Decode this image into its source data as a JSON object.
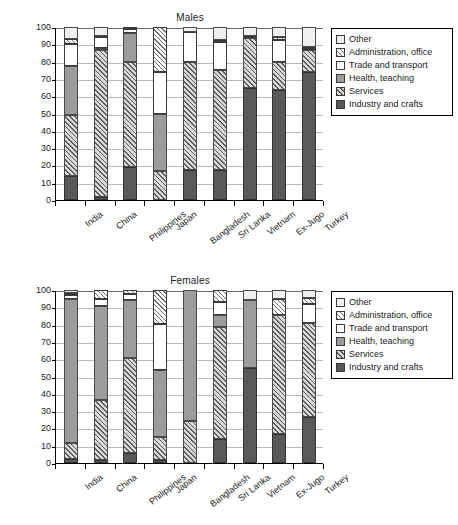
{
  "ylabel": "Percentage",
  "yticks": [
    0,
    10,
    20,
    30,
    40,
    50,
    60,
    70,
    80,
    90,
    100
  ],
  "categories": [
    "India",
    "China",
    "Philippines",
    "Japan",
    "Bangladesh",
    "Sri Lanka",
    "Vietnam",
    "Ex-Jugo",
    "Turkey"
  ],
  "legend": {
    "items": [
      {
        "label": "Other",
        "key": "other",
        "color": "#efefef"
      },
      {
        "label": "Administration, office",
        "key": "admin",
        "color": "#ffffff"
      },
      {
        "label": "Trade and transport",
        "key": "trade",
        "color": "#ffffff"
      },
      {
        "label": "Health, teaching",
        "key": "health",
        "color": "#9c9c9c"
      },
      {
        "label": "Services",
        "key": "services",
        "color": "#d8d8d8"
      },
      {
        "label": "Industry and crafts",
        "key": "industry",
        "color": "#595959"
      }
    ]
  },
  "panels": [
    {
      "id": "males",
      "title": "Males"
    },
    {
      "id": "females",
      "title": "Females"
    }
  ],
  "chart_data": [
    {
      "type": "bar",
      "title": "Males",
      "stacked": true,
      "xlabel": "",
      "ylabel": "Percentage",
      "ylim": [
        0,
        100
      ],
      "grid": true,
      "legend_position": "right",
      "categories": [
        "India",
        "China",
        "Philippines",
        "Japan",
        "Bangladesh",
        "Sri Lanka",
        "Vietnam",
        "Ex-Jugo",
        "Turkey"
      ],
      "series": [
        {
          "name": "Industry and crafts",
          "values": [
            14.0,
            2.0,
            19.0,
            0.0,
            17.5,
            17.5,
            64.5,
            63.5,
            74.0
          ]
        },
        {
          "name": "Services",
          "values": [
            35.0,
            84.5,
            60.5,
            16.5,
            62.0,
            57.5,
            29.0,
            16.0,
            13.0
          ]
        },
        {
          "name": "Health, teaching",
          "values": [
            28.5,
            1.5,
            17.0,
            33.0,
            0.0,
            0.0,
            0.0,
            0.0,
            0.0
          ]
        },
        {
          "name": "Trade and transport",
          "values": [
            12.5,
            6.5,
            2.5,
            24.5,
            17.5,
            16.5,
            1.5,
            13.0,
            0.5
          ]
        },
        {
          "name": "Administration, office",
          "values": [
            3.0,
            0.5,
            1.0,
            26.0,
            0.0,
            1.0,
            0.0,
            1.5,
            1.0
          ]
        },
        {
          "name": "Other",
          "values": [
            7.0,
            5.0,
            0.0,
            0.0,
            3.0,
            7.5,
            5.0,
            6.0,
            11.5
          ]
        }
      ],
      "cumulative_tops": {
        "India": [
          14.0,
          49.0,
          77.5,
          90.0,
          93.0,
          100.0
        ],
        "China": [
          2.0,
          86.5,
          88.0,
          94.5,
          95.0,
          100.0
        ],
        "Philippines": [
          19.0,
          79.5,
          96.5,
          99.0,
          100.0,
          100.0
        ],
        "Japan": [
          0.0,
          16.5,
          49.5,
          74.0,
          100.0,
          100.0
        ],
        "Bangladesh": [
          17.5,
          79.5,
          79.5,
          97.0,
          97.0,
          100.0
        ],
        "Sri Lanka": [
          17.5,
          75.0,
          75.0,
          91.5,
          92.5,
          100.0
        ],
        "Vietnam": [
          64.5,
          93.5,
          93.5,
          95.0,
          95.0,
          100.0
        ],
        "Ex-Jugo": [
          63.5,
          79.5,
          79.5,
          92.5,
          94.0,
          100.0
        ],
        "Turkey": [
          74.0,
          87.0,
          87.0,
          87.5,
          88.5,
          100.0
        ]
      }
    },
    {
      "type": "bar",
      "title": "Females",
      "stacked": true,
      "xlabel": "",
      "ylabel": "Percentage",
      "ylim": [
        0,
        100
      ],
      "grid": true,
      "legend_position": "right",
      "categories": [
        "India",
        "China",
        "Philippines",
        "Japan",
        "Bangladesh",
        "Sri Lanka",
        "Vietnam",
        "Ex-Jugo",
        "Turkey"
      ],
      "series": [
        {
          "name": "Industry and crafts",
          "values": [
            2.5,
            1.5,
            6.0,
            1.5,
            0.0,
            14.0,
            55.0,
            17.0,
            26.5
          ]
        },
        {
          "name": "Services",
          "values": [
            9.0,
            35.0,
            54.5,
            13.5,
            24.5,
            64.5,
            0.0,
            68.5,
            54.5
          ]
        },
        {
          "name": "Health, teaching",
          "values": [
            83.5,
            54.5,
            33.5,
            38.5,
            75.5,
            7.0,
            39.5,
            0.0,
            0.0
          ]
        },
        {
          "name": "Trade and transport",
          "values": [
            2.0,
            4.0,
            3.5,
            27.0,
            0.0,
            7.5,
            0.0,
            0.0,
            11.0
          ]
        },
        {
          "name": "Administration, office",
          "values": [
            1.5,
            5.0,
            2.5,
            19.5,
            0.0,
            7.0,
            0.0,
            9.5,
            3.5
          ]
        },
        {
          "name": "Other",
          "values": [
            1.5,
            0.0,
            0.0,
            0.0,
            0.0,
            0.0,
            5.5,
            5.0,
            4.5
          ]
        }
      ],
      "cumulative_tops": {
        "India": [
          2.5,
          11.5,
          95.0,
          97.0,
          98.5,
          100.0
        ],
        "China": [
          1.5,
          36.5,
          91.0,
          95.0,
          100.0,
          100.0
        ],
        "Philippines": [
          6.0,
          60.5,
          94.0,
          97.5,
          100.0,
          100.0
        ],
        "Japan": [
          1.5,
          15.0,
          53.5,
          80.5,
          100.0,
          100.0
        ],
        "Bangladesh": [
          0.0,
          24.5,
          100.0,
          100.0,
          100.0,
          100.0
        ],
        "Sri Lanka": [
          14.0,
          78.5,
          85.5,
          93.0,
          100.0,
          100.0
        ],
        "Vietnam": [
          55.0,
          55.0,
          94.5,
          94.5,
          94.5,
          100.0
        ],
        "Ex-Jugo": [
          17.0,
          85.5,
          85.5,
          85.5,
          95.0,
          100.0
        ],
        "Turkey": [
          26.5,
          81.0,
          81.0,
          92.0,
          95.5,
          100.0
        ]
      }
    }
  ]
}
